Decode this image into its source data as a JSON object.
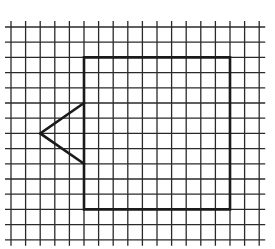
{
  "diagram": {
    "type": "grid-figure",
    "colors": {
      "background": "#ffffff",
      "grid": "#2a2a2a",
      "shape": "#1a1a1a"
    },
    "grid": {
      "columns": 17,
      "rows": 14,
      "x_start": 11,
      "x_step": 14.6,
      "y_start": 27,
      "y_step": 15.2,
      "overhang": 6
    },
    "rectangle": {
      "left_col": 5,
      "top_row": 2,
      "width_cells": 10,
      "height_cells": 10
    },
    "triangle": {
      "tip": {
        "col": 2,
        "row": 7
      },
      "upper_join": {
        "col": 5,
        "row": 5
      },
      "lower_join": {
        "col": 5,
        "row": 9
      }
    }
  }
}
